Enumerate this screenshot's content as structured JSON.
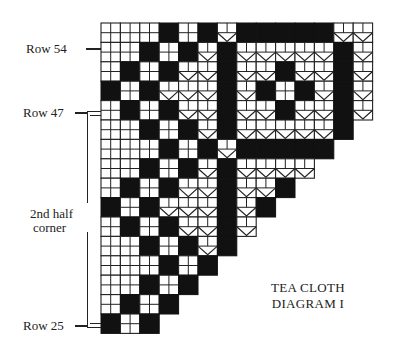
{
  "title": {
    "line1": "TEA CLOTH",
    "line2": "DIAGRAM I"
  },
  "labels": {
    "row_54": "Row 54",
    "row_47": "Row 47",
    "row_25": "Row 25",
    "bracket_line1": "2nd half",
    "bracket_line2": "corner"
  },
  "colors": {
    "ink": "#111111",
    "paper": "#ffffff",
    "grid": "#222222"
  },
  "grid": {
    "legend": {
      "W": "open mesh block (2x2 cells)",
      "B": "solid filled block",
      "V": "lacet / V-bar block"
    },
    "origin": [
      101,
      23
    ],
    "block_size": 19.4,
    "rows": [
      [
        "W",
        "W",
        "W",
        "B",
        "W",
        "B",
        "V",
        "B",
        "B",
        "B",
        "B",
        "B",
        "V",
        "V"
      ],
      [
        "W",
        "W",
        "B",
        "W",
        "B",
        "V",
        "B",
        "V",
        "V",
        "V",
        "V",
        "V",
        "B",
        "V"
      ],
      [
        "W",
        "B",
        "W",
        "B",
        "V",
        "V",
        "B",
        "V",
        "V",
        "B",
        "V",
        "V",
        "B",
        "V"
      ],
      [
        "B",
        "W",
        "B",
        "V",
        "V",
        "V",
        "B",
        "V",
        "B",
        "W",
        "B",
        "V",
        "B",
        "V"
      ],
      [
        "W",
        "B",
        "W",
        "B",
        "V",
        "V",
        "B",
        "V",
        "V",
        "B",
        "V",
        "V",
        "B",
        "V"
      ],
      [
        "W",
        "W",
        "B",
        "W",
        "B",
        "V",
        "B",
        "V",
        "V",
        "V",
        "V",
        "V",
        "B"
      ],
      [
        "W",
        "W",
        "W",
        "B",
        "W",
        "B",
        "V",
        "B",
        "B",
        "B",
        "B",
        "B"
      ],
      [
        "W",
        "W",
        "B",
        "W",
        "B",
        "V",
        "B",
        "V",
        "V",
        "V",
        "V"
      ],
      [
        "W",
        "B",
        "W",
        "B",
        "V",
        "V",
        "B",
        "V",
        "V",
        "B"
      ],
      [
        "B",
        "W",
        "B",
        "V",
        "V",
        "V",
        "B",
        "V",
        "B"
      ],
      [
        "W",
        "B",
        "W",
        "B",
        "V",
        "V",
        "B",
        "V"
      ],
      [
        "W",
        "W",
        "B",
        "W",
        "B",
        "V",
        "B"
      ],
      [
        "W",
        "W",
        "W",
        "B",
        "W",
        "B"
      ],
      [
        "W",
        "W",
        "B",
        "W",
        "B"
      ],
      [
        "W",
        "B",
        "W",
        "B"
      ],
      [
        "B",
        "W",
        "B"
      ]
    ]
  }
}
